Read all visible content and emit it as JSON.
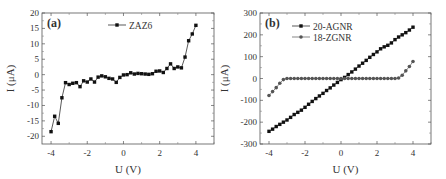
{
  "chart_data": [
    {
      "type": "line",
      "panel_label": "(a)",
      "title": "",
      "xlabel": "U (V)",
      "ylabel": "I (μA)",
      "xlim": [
        -4.5,
        5
      ],
      "ylim": [
        -22.5,
        20
      ],
      "xticks": [
        -4,
        -2,
        0,
        2,
        4
      ],
      "yticks": [
        -20,
        -15,
        -10,
        -5,
        0,
        5,
        10,
        15,
        20
      ],
      "grid": false,
      "legend_position": "top-center",
      "series": [
        {
          "name": "ZAZ6",
          "marker": "square",
          "color": "#111111",
          "x": [
            -4.0,
            -3.8,
            -3.6,
            -3.4,
            -3.2,
            -3.0,
            -2.8,
            -2.6,
            -2.4,
            -2.2,
            -2.0,
            -1.8,
            -1.6,
            -1.4,
            -1.2,
            -1.0,
            -0.8,
            -0.6,
            -0.4,
            -0.2,
            0.0,
            0.2,
            0.4,
            0.6,
            0.8,
            1.0,
            1.2,
            1.4,
            1.6,
            1.8,
            2.0,
            2.2,
            2.4,
            2.6,
            2.8,
            3.0,
            3.2,
            3.4,
            3.6,
            3.8,
            4.0
          ],
          "values": [
            -18.5,
            -13.5,
            -15.8,
            -7.5,
            -2.6,
            -3.2,
            -2.8,
            -2.6,
            -3.9,
            -2.0,
            -2.4,
            -1.4,
            -2.4,
            -0.8,
            -0.4,
            -0.7,
            -1.2,
            -1.4,
            -2.5,
            -0.9,
            -0.1,
            0.0,
            0.6,
            0.2,
            0.4,
            0.3,
            0.2,
            0.1,
            0.3,
            1.1,
            1.2,
            0.7,
            2.0,
            3.5,
            2.0,
            2.5,
            2.2,
            5.7,
            11.0,
            13.2,
            16.0
          ]
        }
      ]
    },
    {
      "type": "line",
      "panel_label": "(b)",
      "title": "",
      "xlabel": "U (V)",
      "ylabel": "I (μA)",
      "xlim": [
        -4.5,
        5
      ],
      "ylim": [
        -300,
        300
      ],
      "xticks": [
        -4,
        -2,
        0,
        2,
        4
      ],
      "yticks": [
        -300,
        -200,
        -100,
        0,
        100,
        200,
        300
      ],
      "grid": false,
      "legend_position": "top-left",
      "series": [
        {
          "name": "20-AGNR",
          "marker": "square",
          "color": "#111111",
          "x": [
            -4.0,
            -3.8,
            -3.6,
            -3.4,
            -3.2,
            -3.0,
            -2.8,
            -2.6,
            -2.4,
            -2.2,
            -2.0,
            -1.8,
            -1.6,
            -1.4,
            -1.2,
            -1.0,
            -0.8,
            -0.6,
            -0.4,
            -0.2,
            0.0,
            0.2,
            0.4,
            0.6,
            0.8,
            1.0,
            1.2,
            1.4,
            1.6,
            1.8,
            2.0,
            2.2,
            2.4,
            2.6,
            2.8,
            3.0,
            3.2,
            3.4,
            3.6,
            3.8,
            4.0
          ],
          "values": [
            -242,
            -232,
            -220,
            -210,
            -200,
            -190,
            -178,
            -165,
            -155,
            -145,
            -132,
            -118,
            -105,
            -92,
            -80,
            -68,
            -55,
            -43,
            -30,
            -18,
            -5,
            5,
            18,
            30,
            43,
            57,
            70,
            83,
            97,
            110,
            122,
            136,
            145,
            152,
            163,
            178,
            190,
            200,
            210,
            222,
            235
          ]
        },
        {
          "name": "18-ZGNR",
          "marker": "circle",
          "color": "#555555",
          "x": [
            -4.0,
            -3.8,
            -3.6,
            -3.4,
            -3.2,
            -3.0,
            -2.8,
            -2.6,
            -2.4,
            -2.2,
            -2.0,
            -1.8,
            -1.6,
            -1.4,
            -1.2,
            -1.0,
            -0.8,
            -0.6,
            -0.4,
            -0.2,
            0.0,
            0.2,
            0.4,
            0.6,
            0.8,
            1.0,
            1.2,
            1.4,
            1.6,
            1.8,
            2.0,
            2.2,
            2.4,
            2.6,
            2.8,
            3.0,
            3.2,
            3.4,
            3.6,
            3.8,
            4.0
          ],
          "values": [
            -78,
            -60,
            -42,
            -22,
            -5,
            0,
            0,
            0,
            0,
            0,
            0,
            0,
            0,
            0,
            0,
            0,
            0,
            0,
            0,
            0,
            0,
            0,
            0,
            0,
            0,
            0,
            0,
            0,
            0,
            0,
            0,
            0,
            0,
            0,
            0,
            0,
            2,
            15,
            35,
            55,
            78
          ]
        }
      ]
    }
  ]
}
